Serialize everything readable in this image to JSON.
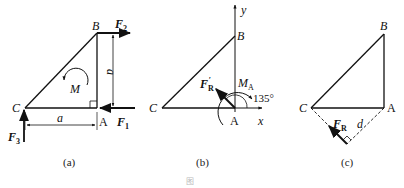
{
  "figures": [
    {
      "id": "a",
      "caption": "(a)",
      "points": {
        "B": "B",
        "C": "C",
        "A": "A"
      },
      "forces": {
        "F1": "F",
        "F1_sub": "1",
        "F2": "F",
        "F2_sub": "2",
        "F3": "F",
        "F3_sub": "3"
      },
      "moment": "M",
      "dims": {
        "horizontal": "a",
        "vertical": "a"
      }
    },
    {
      "id": "b",
      "caption": "(b)",
      "points": {
        "B": "B",
        "C": "C",
        "A": "A"
      },
      "axes": {
        "x": "x",
        "y": "y"
      },
      "resultant": {
        "label": "F",
        "sub": "R",
        "prime": "′"
      },
      "moment": {
        "label": "M",
        "sub": "A"
      },
      "angle": "135°"
    },
    {
      "id": "c",
      "caption": "(c)",
      "points": {
        "B": "B",
        "C": "C",
        "A": "A"
      },
      "resultant": {
        "label": "F",
        "sub": "R"
      },
      "distance": "d"
    }
  ],
  "figure_caption": "图"
}
